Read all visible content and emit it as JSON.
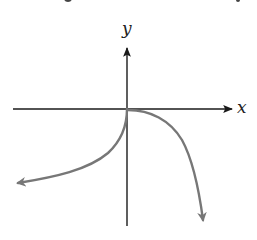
{
  "diagram": {
    "type": "function-graph",
    "axes": {
      "x_label": "x",
      "y_label": "y",
      "origin_px": [
        127,
        109
      ],
      "x_axis_px": {
        "from": [
          13,
          109
        ],
        "to": [
          232,
          109
        ]
      },
      "y_axis_px": {
        "from": [
          127,
          226
        ],
        "to": [
          127,
          48
        ]
      },
      "color": "#1a1a1a"
    },
    "curves": [
      {
        "name": "left-branch",
        "description": "from origin, drops steeply then flattens toward lower-left, arrow at end",
        "color": "#777777",
        "path": "M127,109 C127,125 122,140 108,153 C88,170 55,177 18,183"
      },
      {
        "name": "right-branch",
        "description": "from origin, flat then curves steeply down toward lower-right, arrow at end",
        "color": "#777777",
        "path": "M128,110 C150,110 170,120 182,140 C193,160 199,190 203,220"
      }
    ]
  }
}
